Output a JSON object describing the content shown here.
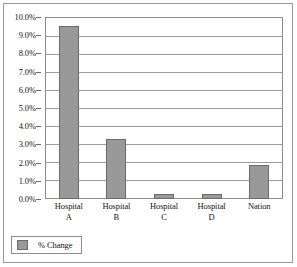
{
  "chart_data": {
    "type": "bar",
    "title": "",
    "subtitle": "",
    "xlabel": "",
    "ylabel": "",
    "categories": [
      "Hospital A",
      "Hospital B",
      "Hospital C",
      "Hospital D",
      "Nation"
    ],
    "category_lines": [
      [
        "Hospital",
        "A"
      ],
      [
        "Hospital",
        "B"
      ],
      [
        "Hospital",
        "C"
      ],
      [
        "Hospital",
        "D"
      ],
      [
        "Nation",
        ""
      ]
    ],
    "series": [
      {
        "name": "% Change",
        "values": [
          9.5,
          3.3,
          0.25,
          0.25,
          1.85
        ],
        "color": "#999999"
      }
    ],
    "ylim": [
      0,
      10
    ],
    "ytick_values": [
      10,
      9,
      8,
      7,
      6,
      5,
      4,
      3,
      2,
      1,
      0
    ],
    "ytick_labels": [
      "10.0%",
      "9.0%",
      "8.0%",
      "7.0%",
      "6.0%",
      "5.0%",
      "4.0%",
      "3.0%",
      "2.0%",
      "1.0%",
      "0.0%"
    ],
    "grid": true,
    "legend_position": "bottom-left",
    "legend_entries": [
      "% Change"
    ]
  },
  "legend": {
    "label": "% Change"
  },
  "axis": {
    "y": {
      "t0": "10.0%",
      "t1": "9.0%",
      "t2": "8.0%",
      "t3": "7.0%",
      "t4": "6.0%",
      "t5": "5.0%",
      "t6": "4.0%",
      "t7": "3.0%",
      "t8": "2.0%",
      "t9": "1.0%",
      "t10": "0.0%"
    },
    "x": {
      "c0l1": "Hospital",
      "c0l2": "A",
      "c1l1": "Hospital",
      "c1l2": "B",
      "c2l1": "Hospital",
      "c2l2": "C",
      "c3l1": "Hospital",
      "c3l2": "D",
      "c4l1": "Nation",
      "c4l2": ""
    }
  }
}
